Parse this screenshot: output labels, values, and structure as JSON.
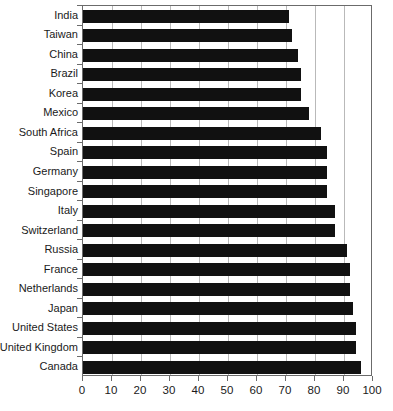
{
  "chart_data": {
    "type": "bar",
    "orientation": "horizontal",
    "title": "",
    "subtitle": "",
    "xlabel": "",
    "ylabel": "",
    "xlim": [
      0,
      100
    ],
    "ylim": null,
    "grid": true,
    "grid_axis": "x",
    "legend": null,
    "legend_position": "none",
    "xticks": [
      0,
      10,
      20,
      30,
      40,
      50,
      60,
      70,
      80,
      90,
      100
    ],
    "xtick_labels": [
      "0",
      "10",
      "20",
      "30",
      "40",
      "50",
      "60",
      "70",
      "80",
      "90",
      "100"
    ],
    "gridline_values": [
      10,
      20,
      30,
      40,
      50,
      60,
      70,
      80,
      90
    ],
    "bar_color": "#111111",
    "categories": [
      "India",
      "Taiwan",
      "China",
      "Brazil",
      "Korea",
      "Mexico",
      "South Africa",
      "Spain",
      "Germany",
      "Singapore",
      "Italy",
      "Switzerland",
      "Russia",
      "France",
      "Netherlands",
      "Japan",
      "United States",
      "United Kingdom",
      "Canada"
    ],
    "values": [
      71,
      72,
      74,
      75,
      75,
      78,
      82,
      84,
      84,
      84,
      87,
      87,
      91,
      92,
      92,
      93,
      94,
      94,
      96
    ]
  },
  "axes": {
    "x_axis_min_label": "0",
    "x_axis_max_label": "100"
  }
}
